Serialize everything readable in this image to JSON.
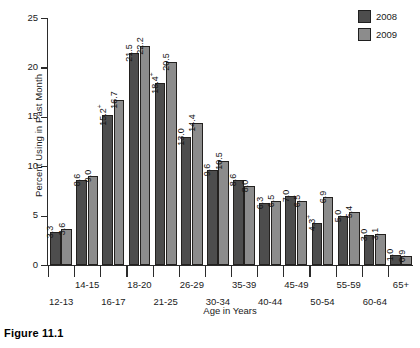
{
  "figure": {
    "caption": "Figure 11.1"
  },
  "chart_data": {
    "type": "bar",
    "title": "",
    "xlabel": "Age in Years",
    "ylabel": "Percent Using in Past Month",
    "ylim": [
      0,
      25
    ],
    "yticks": [
      0,
      5,
      10,
      15,
      20,
      25
    ],
    "ytick_labels": [
      "0",
      "5",
      "10",
      "15",
      "20",
      "25"
    ],
    "grid": false,
    "legend_position": "top-right",
    "categories": [
      "12-13",
      "14-15",
      "16-17",
      "18-20",
      "21-25",
      "26-29",
      "30-34",
      "35-39",
      "40-44",
      "45-49",
      "50-54",
      "55-59",
      "60-64",
      "65+"
    ],
    "series": [
      {
        "name": "2008",
        "color": "#4d4d4d",
        "values": [
          3.3,
          8.6,
          15.2,
          21.5,
          18.4,
          13.0,
          9.6,
          8.6,
          6.3,
          7.0,
          4.3,
          5.0,
          3.0,
          1.0
        ],
        "labels": [
          "3.3",
          "8.6",
          "15.2+",
          "21.5",
          "18.4+",
          "13.0",
          "9.6",
          "8.6",
          "6.3",
          "7.0",
          "4.3+",
          "5.0",
          "3.0",
          "1.0"
        ]
      },
      {
        "name": "2009",
        "color": "#8c8c8c",
        "values": [
          3.6,
          9.0,
          16.7,
          22.2,
          20.5,
          14.4,
          10.5,
          8.0,
          6.5,
          6.5,
          6.9,
          5.4,
          3.1,
          0.9
        ],
        "labels": [
          "3.6",
          "9.0",
          "16.7",
          "22.2",
          "20.5",
          "14.4",
          "10.5",
          "8.0",
          "6.5",
          "6.5",
          "6.9",
          "5.4",
          "3.1",
          "0.9"
        ]
      }
    ],
    "annotations": "A '+' superscript marks values with a statistically significant difference between 2008 and 2009."
  },
  "legend": {
    "entries": [
      {
        "label": "2008",
        "color": "#4d4d4d"
      },
      {
        "label": "2009",
        "color": "#8c8c8c"
      }
    ]
  }
}
